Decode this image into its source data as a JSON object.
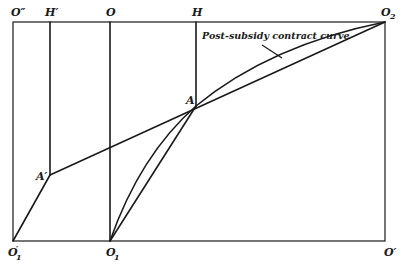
{
  "diagram": {
    "labels": {
      "o_double_prime": "O″",
      "h_prime": "H′",
      "o": "O",
      "h": "H",
      "o2_main": "O",
      "o2_sub": "2",
      "a": "A",
      "a_prime": "A′",
      "o1_prime_main": "O",
      "o1_prime_mark": "′",
      "o1_prime_sub": "1",
      "o1_main": "O",
      "o1_sub": "1",
      "o_prime": "O′"
    },
    "curve_label": "Post-subsidy contract curve",
    "colors": {
      "ink": "#1a1a1a",
      "background": "#ffffff"
    }
  }
}
